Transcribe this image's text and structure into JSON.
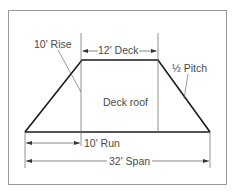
{
  "diagram": {
    "title": "Deck roof",
    "labels": {
      "rise": "10' Rise",
      "deck": "12' Deck",
      "pitch": "½ Pitch",
      "center": "Deck roof",
      "run": "10' Run",
      "span": "32' Span"
    },
    "dimensions": {
      "rise_ft": 10,
      "deck_ft": 12,
      "run_ft": 10,
      "span_ft": 32,
      "pitch": "1/2"
    },
    "colors": {
      "line": "#1a1a1a",
      "dimension": "#555555",
      "frame": "#9a9a9a",
      "text": "#4a4a4a"
    }
  }
}
